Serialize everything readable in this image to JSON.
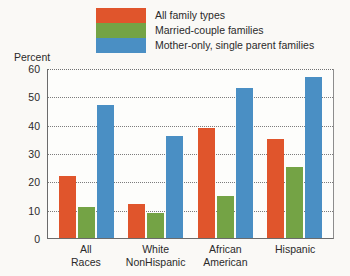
{
  "axis_title": "Percent",
  "colors": {
    "all_family_types": "#e0552c",
    "married_couple": "#74a345",
    "mother_only": "#4a8fc4",
    "axis": "#6b6b6b",
    "grid": "#7c7c7c",
    "text": "#2a2a2a",
    "background": "#faf9f6"
  },
  "legend": {
    "items": [
      {
        "label": "All family types",
        "color": "#e0552c"
      },
      {
        "label": "Married-couple families",
        "color": "#74a345"
      },
      {
        "label": "Mother-only, single parent families",
        "color": "#4a8fc4"
      }
    ]
  },
  "yaxis": {
    "ticks": [
      "60",
      "50",
      "40",
      "30",
      "20",
      "10",
      "0"
    ]
  },
  "xaxis": {
    "groups": [
      {
        "line1": "All",
        "line2": "Races"
      },
      {
        "line1": "White",
        "line2": "NonHispanic"
      },
      {
        "line1": "African",
        "line2": "American"
      },
      {
        "line1": "Hispanic",
        "line2": ""
      }
    ]
  },
  "chart_data": {
    "type": "bar",
    "title": "",
    "subtitle": "",
    "xlabel": "",
    "ylabel": "Percent",
    "ylim": [
      0,
      60
    ],
    "ytick_step": 10,
    "grid": true,
    "legend_position": "top",
    "categories": [
      "All Races",
      "White NonHispanic",
      "African American",
      "Hispanic"
    ],
    "series": [
      {
        "name": "All family types",
        "color": "#e0552c",
        "values": [
          22,
          12,
          39,
          35
        ]
      },
      {
        "name": "Married-couple families",
        "color": "#74a345",
        "values": [
          11,
          9,
          15,
          25
        ]
      },
      {
        "name": "Mother-only, single parent families",
        "color": "#4a8fc4",
        "values": [
          47,
          36,
          53,
          57
        ]
      }
    ]
  }
}
